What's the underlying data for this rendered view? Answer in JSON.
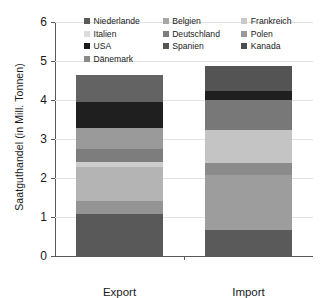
{
  "chart_data": {
    "type": "bar",
    "subtype": "stacked-column",
    "title": "",
    "xlabel": "",
    "ylabel": "Saatguthandel (in Mill. Tonnen)",
    "categories": [
      "Export",
      "Import"
    ],
    "ylim": [
      0,
      6
    ],
    "ytick_labels": [
      "0",
      "1",
      "2",
      "3",
      "4",
      "5",
      "6"
    ],
    "ytick_values": [
      0,
      1,
      2,
      3,
      4,
      5,
      6
    ],
    "grid": true,
    "grid_axis": "y",
    "legend_position": "top-inside",
    "legend_columns": 3,
    "stack_order_bottom_to_top": [
      "Niederlande",
      "Italien",
      "USA",
      "Dänemark",
      "Belgien",
      "Deutschland",
      "Spanien",
      "Frankreich",
      "Polen",
      "Kanada"
    ],
    "series": [
      {
        "name": "Niederlande",
        "color": "#595959",
        "values": [
          1.08,
          0.67
        ]
      },
      {
        "name": "Italien",
        "color": "#d9d9d9",
        "values": [
          0.32,
          0.0
        ]
      },
      {
        "name": "USA",
        "color": "#1a1a1a",
        "values": [
          0.0,
          0.0
        ]
      },
      {
        "name": "Dänemark",
        "color": "#7f7f7f",
        "values": [
          0.87,
          1.41
        ]
      },
      {
        "name": "Belgien",
        "color": "#a6a6a6",
        "values": [
          0.13,
          0.3
        ]
      },
      {
        "name": "Deutschland",
        "color": "#808080",
        "values": [
          0.35,
          0.84
        ]
      },
      {
        "name": "Spanien",
        "color": "#404040",
        "values": [
          0.52,
          0.0
        ]
      },
      {
        "name": "Frankreich",
        "color": "#bfbfbf",
        "values": [
          0.0,
          0.78
        ]
      },
      {
        "name": "Polen",
        "color": "#737373",
        "values": [
          0.68,
          0.22
        ]
      },
      {
        "name": "Kanada",
        "color": "#4d4d4d",
        "values": [
          0.7,
          0.66
        ]
      }
    ],
    "bars": [
      {
        "category": "Export",
        "total": 4.65,
        "segments": [
          {
            "label": "Niederlande",
            "value": 1.08,
            "y0": 0.0,
            "y1": 1.08,
            "color": "#595959"
          },
          {
            "label": "Italien",
            "value": 0.32,
            "y0": 1.08,
            "y1": 1.4,
            "color": "#949494"
          },
          {
            "label": "Belgien",
            "value": 0.87,
            "y0": 1.4,
            "y1": 2.27,
            "color": "#b4b4b4"
          },
          {
            "label": "Frankreich",
            "value": 0.13,
            "y0": 2.27,
            "y1": 2.4,
            "color": "#cdcdcd"
          },
          {
            "label": "Deutschland",
            "value": 0.35,
            "y0": 2.4,
            "y1": 2.75,
            "color": "#7d7d7d"
          },
          {
            "label": "Polen",
            "value": 0.52,
            "y0": 2.75,
            "y1": 3.27,
            "color": "#9a9a9a"
          },
          {
            "label": "USA",
            "value": 0.68,
            "y0": 3.27,
            "y1": 3.95,
            "color": "#1f1f1f"
          },
          {
            "label": "Spanien",
            "value": 0.7,
            "y0": 3.95,
            "y1": 4.65,
            "color": "#636363"
          }
        ]
      },
      {
        "category": "Import",
        "total": 4.88,
        "segments": [
          {
            "label": "Niederlande",
            "value": 0.67,
            "y0": 0.0,
            "y1": 0.67,
            "color": "#5a5a5a"
          },
          {
            "label": "Dänemark",
            "value": 1.41,
            "y0": 0.67,
            "y1": 2.08,
            "color": "#9d9d9d"
          },
          {
            "label": "Belgien",
            "value": 0.3,
            "y0": 2.08,
            "y1": 2.38,
            "color": "#8b8b8b"
          },
          {
            "label": "Italien",
            "value": 0.84,
            "y0": 2.38,
            "y1": 3.22,
            "color": "#c4c4c4"
          },
          {
            "label": "Deutschland",
            "value": 0.78,
            "y0": 3.22,
            "y1": 4.0,
            "color": "#787878"
          },
          {
            "label": "USA",
            "value": 0.22,
            "y0": 4.0,
            "y1": 4.22,
            "color": "#1f1f1f"
          },
          {
            "label": "Kanada",
            "value": 0.66,
            "y0": 4.22,
            "y1": 4.88,
            "color": "#545454"
          }
        ]
      }
    ]
  },
  "legend": {
    "items": [
      {
        "label": "Niederlande",
        "color": "#595959"
      },
      {
        "label": "Belgien",
        "color": "#a6a6a6"
      },
      {
        "label": "Frankreich",
        "color": "#c9c9c9"
      },
      {
        "label": "Italien",
        "color": "#dcdcdc"
      },
      {
        "label": "Deutschland",
        "color": "#7d7d7d"
      },
      {
        "label": "Polen",
        "color": "#9a9a9a"
      },
      {
        "label": "USA",
        "color": "#1a1a1a"
      },
      {
        "label": "Spanien",
        "color": "#555555"
      },
      {
        "label": "Kanada",
        "color": "#4d4d4d"
      },
      {
        "label": "Dänemark",
        "color": "#8a8a8a"
      }
    ]
  },
  "axes": {
    "y_title": "Saatguthandel (in Mill. Tonnen)",
    "y_ticks": [
      "6",
      "5",
      "4",
      "3",
      "2",
      "1",
      "0"
    ],
    "x_ticks": [
      "Export",
      "Import"
    ]
  }
}
